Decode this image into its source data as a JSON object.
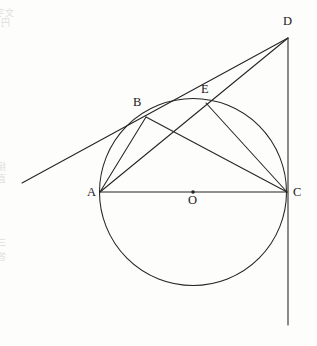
{
  "figure": {
    "canvas": {
      "width": 317,
      "height": 346
    },
    "stroke_color": "#242424",
    "background_color": "#fdfdfb",
    "circle": {
      "cx": 193,
      "cy": 192,
      "r": 93.5,
      "label": "circle-O"
    },
    "center_dot": {
      "cx": 193,
      "cy": 192,
      "r": 1.8
    },
    "points": [
      {
        "id": "A",
        "label": "A",
        "x": 100,
        "y": 192,
        "label_x": 87,
        "label_y": 186
      },
      {
        "id": "B",
        "label": "B",
        "x": 146,
        "y": 117,
        "label_x": 133,
        "label_y": 96
      },
      {
        "id": "C",
        "label": "C",
        "x": 287,
        "y": 192,
        "label_x": 293,
        "label_y": 186
      },
      {
        "id": "D",
        "label": "D",
        "x": 288,
        "y": 38,
        "label_x": 283,
        "label_y": 15
      },
      {
        "id": "E",
        "label": "E",
        "x": 206,
        "y": 103,
        "label_x": 201,
        "label_y": 83
      },
      {
        "id": "O",
        "label": "O",
        "x": 193,
        "y": 192,
        "label_x": 188,
        "label_y": 194
      }
    ],
    "segments": [
      {
        "id": "AC",
        "from": "A",
        "to": "C",
        "x1": 100,
        "y1": 192,
        "x2": 287,
        "y2": 192,
        "name": "segment-ac-diameter"
      },
      {
        "id": "AB",
        "from": "A",
        "to": "B",
        "x1": 100,
        "y1": 192,
        "x2": 146,
        "y2": 117,
        "name": "segment-ab"
      },
      {
        "id": "AD",
        "from": "A",
        "to": "D",
        "x1": 100,
        "y1": 192,
        "x2": 288,
        "y2": 38,
        "name": "segment-ad-through-e"
      },
      {
        "id": "BC",
        "from": "B",
        "to": "C",
        "x1": 146,
        "y1": 117,
        "x2": 287,
        "y2": 192,
        "name": "segment-bc"
      },
      {
        "id": "EC",
        "from": "E",
        "to": "C",
        "x1": 206,
        "y1": 103,
        "x2": 287,
        "y2": 192,
        "name": "segment-ec"
      },
      {
        "id": "tangent-B",
        "from": "tangent-start",
        "to": "D",
        "x1": 22,
        "y1": 183,
        "x2": 288,
        "y2": 38,
        "name": "tangent-line-at-b"
      },
      {
        "id": "tangent-C",
        "from": "D",
        "to": "tangent-end",
        "x1": 288,
        "y1": 38,
        "x2": 288,
        "y2": 325,
        "name": "tangent-line-at-c-vertical"
      }
    ],
    "bleed_text": [
      {
        "text": "文字の試験問題と解答",
        "x": 14,
        "y": 6,
        "size": 9
      },
      {
        "text": "円の接線と弦の定理についての問題",
        "x": 10,
        "y": 16,
        "size": 9
      },
      {
        "text": "接線 BD と CD は等しいことを示せ",
        "x": 6,
        "y": 160,
        "size": 9
      },
      {
        "text": "直径 AC に対する円周角の性質",
        "x": 6,
        "y": 172,
        "size": 9
      },
      {
        "text": "三角形の相似を用いて証明する",
        "x": 6,
        "y": 236,
        "size": 9
      },
      {
        "text": "答え ： 角 BAE ＝ 角 ECD",
        "x": 6,
        "y": 250,
        "size": 9
      }
    ]
  }
}
